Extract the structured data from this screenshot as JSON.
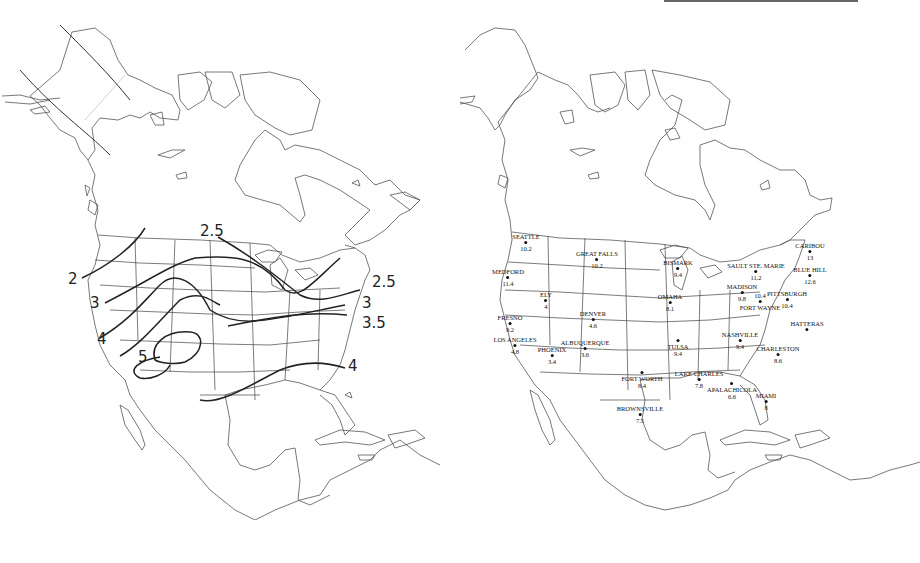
{
  "figure": {
    "left_panel": {
      "description": "Isoline map of the United States",
      "isolines": [
        {
          "value": "2",
          "label": "2"
        },
        {
          "value": "2.5",
          "label": "2.5"
        },
        {
          "value": "2.5",
          "label": "2.5"
        },
        {
          "value": "3",
          "label": "3"
        },
        {
          "value": "3",
          "label": "3"
        },
        {
          "value": "3.5",
          "label": "3.5"
        },
        {
          "value": "4",
          "label": "4"
        },
        {
          "value": "4",
          "label": "4"
        },
        {
          "value": "5",
          "label": "5"
        }
      ]
    },
    "right_panel": {
      "description": "Station values map of the United States",
      "cities": [
        {
          "name": "SEATTLE",
          "value": "10.2"
        },
        {
          "name": "GREAT FALLS",
          "value": "10.2"
        },
        {
          "name": "BISMARK",
          "value": "9.4"
        },
        {
          "name": "SAULT STE. MARIE",
          "value": "11.2"
        },
        {
          "name": "CARIBOU",
          "value": "13"
        },
        {
          "name": "BLUE HILL",
          "value": "12.6"
        },
        {
          "name": "MEDFORD",
          "value": "11.4"
        },
        {
          "name": "MADISON",
          "value": "9.8"
        },
        {
          "name": "FORT WAYNE",
          "value": "10.4"
        },
        {
          "name": "PITTSBURGH",
          "value": "10.4"
        },
        {
          "name": "ELY",
          "value": "4"
        },
        {
          "name": "OMAHA",
          "value": "8.1"
        },
        {
          "name": "DENVER",
          "value": "4.6"
        },
        {
          "name": "FRESNO",
          "value": "9.2"
        },
        {
          "name": "LOS ANGELES",
          "value": "4.8"
        },
        {
          "name": "PHOENIX",
          "value": "3.4"
        },
        {
          "name": "ALBUQUERQUE",
          "value": "3.6"
        },
        {
          "name": "TULSA",
          "value": "9.4"
        },
        {
          "name": "HATTERAS",
          "value": ""
        },
        {
          "name": "NASHVILLE",
          "value": "9.4"
        },
        {
          "name": "CHARLESTON",
          "value": "8.6"
        },
        {
          "name": "FORT WORTH",
          "value": "8.4"
        },
        {
          "name": "LAKE CHARLES",
          "value": "7.8"
        },
        {
          "name": "APALACHICOLA",
          "value": "6.6"
        },
        {
          "name": "MIAMI",
          "value": "8"
        },
        {
          "name": "BROWNSVILLE",
          "value": "7.5"
        }
      ]
    }
  }
}
